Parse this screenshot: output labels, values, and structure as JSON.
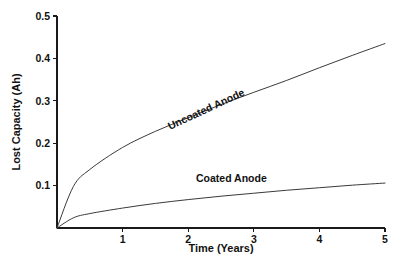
{
  "chart_data": {
    "type": "line",
    "title": "",
    "xlabel": "Time (Years)",
    "ylabel": "Lost Capacity (Ah)",
    "xlim": [
      0,
      5
    ],
    "ylim": [
      0,
      0.5
    ],
    "grid": false,
    "legend_position": "inline-curve-labels",
    "xticks": [
      "1",
      "2",
      "3",
      "4",
      "5"
    ],
    "xtick_values": [
      1,
      2,
      3,
      4,
      5
    ],
    "yticks": [
      "0.1",
      "0.2",
      "0.3",
      "0.4",
      "0.5"
    ],
    "ytick_values": [
      0.1,
      0.2,
      0.3,
      0.4,
      0.5
    ],
    "x": [
      0,
      0.25,
      0.5,
      1,
      1.5,
      2,
      2.5,
      3,
      3.5,
      4,
      4.5,
      5
    ],
    "series": [
      {
        "name": "Uncoated Anode",
        "label": "Uncoated Anode",
        "color": "#3a3a3a",
        "label_rotation_deg": -25,
        "values": [
          0,
          0.098,
          0.138,
          0.19,
          0.228,
          0.26,
          0.291,
          0.32,
          0.348,
          0.378,
          0.407,
          0.435
        ]
      },
      {
        "name": "Coated Anode",
        "label": "Coated Anode",
        "color": "#3a3a3a",
        "label_rotation_deg": 0,
        "values": [
          0,
          0.024,
          0.034,
          0.047,
          0.058,
          0.067,
          0.075,
          0.082,
          0.089,
          0.095,
          0.101,
          0.106
        ]
      }
    ],
    "axis_color": "#1a1a1a",
    "background_color": "#ffffff"
  },
  "geometry": {
    "origin_x": 57,
    "origin_y": 228,
    "x_axis_end": 385,
    "y_axis_top": 16,
    "px_per_year": 65.6,
    "px_per_unit_y": 424
  }
}
